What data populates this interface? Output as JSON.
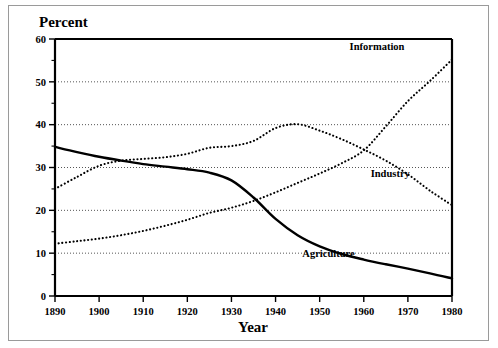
{
  "chart_data": {
    "type": "line",
    "title": "",
    "xlabel": "Year",
    "ylabel": "Percent",
    "xlim": [
      1890,
      1980
    ],
    "ylim": [
      0,
      60
    ],
    "xticks": [
      1890,
      1900,
      1910,
      1920,
      1930,
      1940,
      1950,
      1960,
      1970,
      1980
    ],
    "xtick_labels": [
      "1890",
      "1900",
      "1910",
      "1920",
      "1930",
      "1940",
      "1950",
      "1960",
      "1970",
      "1980"
    ],
    "yticks": [
      0,
      10,
      20,
      30,
      40,
      50,
      60
    ],
    "ytick_labels": [
      "0",
      "10",
      "20",
      "30",
      "40",
      "50",
      "60"
    ],
    "yticks_minor": [
      5,
      15,
      25,
      35,
      45,
      55
    ],
    "grid": "horizontal-dotted",
    "legend_position": "inline-right-labels",
    "x": [
      1890,
      1895,
      1900,
      1905,
      1910,
      1915,
      1920,
      1925,
      1930,
      1935,
      1940,
      1945,
      1950,
      1955,
      1960,
      1965,
      1970,
      1975,
      1980
    ],
    "series": [
      {
        "name": "Agriculture",
        "label": "Agriculture",
        "style": "solid",
        "color": "#000000",
        "values": [
          34.8,
          33.6,
          32.5,
          31.6,
          30.8,
          30.2,
          29.6,
          28.8,
          27.0,
          23.0,
          18.0,
          14.2,
          11.6,
          9.8,
          8.5,
          7.4,
          6.4,
          5.3,
          4.1
        ]
      },
      {
        "name": "Industry",
        "label": "Industry",
        "style": "dotted",
        "color": "#000000",
        "values": [
          25.0,
          27.8,
          30.4,
          31.6,
          32.0,
          32.4,
          33.2,
          34.6,
          35.0,
          36.2,
          39.2,
          40.1,
          38.6,
          36.6,
          34.2,
          31.6,
          28.4,
          24.6,
          21.2
        ]
      },
      {
        "name": "Information",
        "label": "Information",
        "style": "dotted",
        "color": "#000000",
        "values": [
          12.2,
          12.8,
          13.4,
          14.2,
          15.2,
          16.4,
          17.8,
          19.4,
          20.6,
          22.2,
          24.2,
          26.4,
          28.6,
          31.0,
          34.0,
          39.6,
          45.5,
          50.2,
          55.2
        ]
      }
    ],
    "series_label_positions": [
      {
        "name": "Information",
        "x": 1963,
        "y": 57.5
      },
      {
        "name": "Industry",
        "x": 1966,
        "y": 27.8
      },
      {
        "name": "Agriculture",
        "x": 1952,
        "y": 9.2
      }
    ]
  }
}
